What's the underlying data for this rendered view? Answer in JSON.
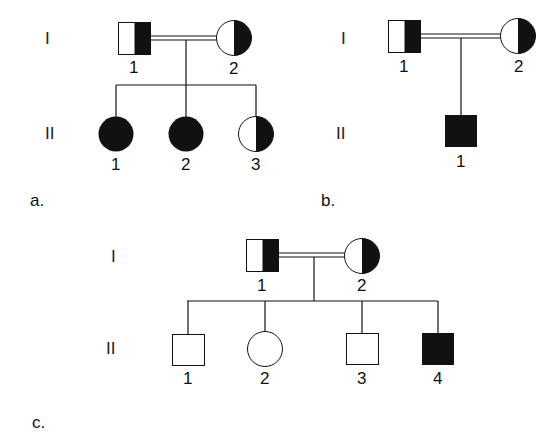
{
  "colors": {
    "ink": "#111111",
    "background": "#ffffff"
  },
  "legend": {
    "half_filled": "heterozygous carrier",
    "filled": "affected",
    "open": "unaffected",
    "double_line": "consanguineous mating"
  },
  "pedigrees": [
    {
      "panel_label": "a.",
      "generations": [
        "I",
        "II"
      ],
      "parents": [
        {
          "label": "1",
          "sex": "male",
          "status": "carrier"
        },
        {
          "label": "2",
          "sex": "female",
          "status": "carrier"
        }
      ],
      "mating": "consanguineous",
      "children": [
        {
          "label": "1",
          "sex": "female",
          "status": "affected"
        },
        {
          "label": "2",
          "sex": "female",
          "status": "affected"
        },
        {
          "label": "3",
          "sex": "female",
          "status": "carrier"
        }
      ]
    },
    {
      "panel_label": "b.",
      "generations": [
        "I",
        "II"
      ],
      "parents": [
        {
          "label": "1",
          "sex": "male",
          "status": "carrier"
        },
        {
          "label": "2",
          "sex": "female",
          "status": "carrier"
        }
      ],
      "mating": "consanguineous",
      "children": [
        {
          "label": "1",
          "sex": "male",
          "status": "affected"
        }
      ]
    },
    {
      "panel_label": "c.",
      "generations": [
        "I",
        "II"
      ],
      "parents": [
        {
          "label": "1",
          "sex": "male",
          "status": "carrier"
        },
        {
          "label": "2",
          "sex": "female",
          "status": "carrier"
        }
      ],
      "mating": "consanguineous",
      "children": [
        {
          "label": "1",
          "sex": "male",
          "status": "unaffected"
        },
        {
          "label": "2",
          "sex": "female",
          "status": "unaffected"
        },
        {
          "label": "3",
          "sex": "male",
          "status": "unaffected"
        },
        {
          "label": "4",
          "sex": "male",
          "status": "affected"
        }
      ]
    }
  ]
}
